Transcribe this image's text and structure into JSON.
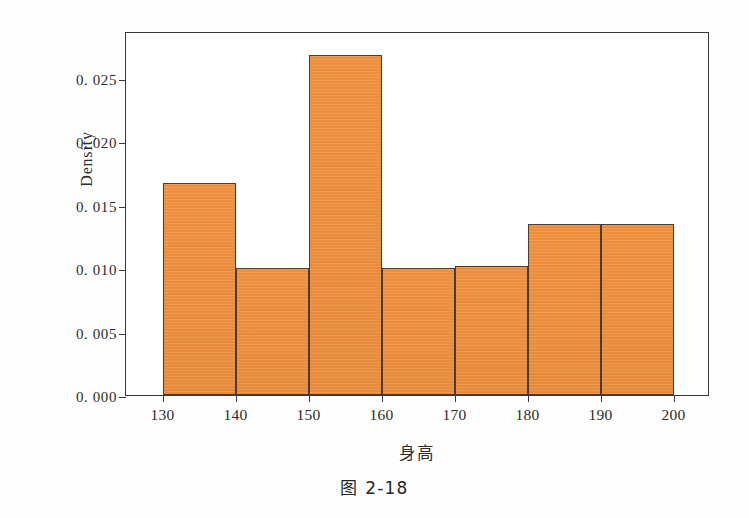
{
  "caption": "图 2-18",
  "chart_data": {
    "type": "bar",
    "subtype": "histogram",
    "title": "",
    "xlabel": "身高",
    "ylabel": "Density",
    "xlim": [
      125,
      205
    ],
    "ylim": [
      0.0,
      0.0287
    ],
    "grid": false,
    "legend": null,
    "bin_width": 10,
    "bin_edges": [
      130,
      140,
      150,
      160,
      170,
      180,
      190,
      200
    ],
    "categories": [
      "130-140",
      "140-150",
      "150-160",
      "160-170",
      "170-180",
      "180-190",
      "190-200"
    ],
    "values": [
      0.0167,
      0.01,
      0.0268,
      0.01,
      0.0102,
      0.0135,
      0.0135
    ],
    "xticks": [
      130,
      140,
      150,
      160,
      170,
      180,
      190,
      200
    ],
    "xtick_labels": [
      "130",
      "140",
      "150",
      "160",
      "170",
      "180",
      "190",
      "200"
    ],
    "yticks": [
      0.0,
      0.005,
      0.01,
      0.015,
      0.02,
      0.025
    ],
    "ytick_labels": [
      "0. 000",
      "0. 005",
      "0. 010",
      "0. 015",
      "0. 020",
      "0. 025"
    ],
    "bar_color": "#f0903e",
    "bar_edge_color": "#4a3b33",
    "axis_color": "#3b3736",
    "background_color": "#ffffff"
  }
}
